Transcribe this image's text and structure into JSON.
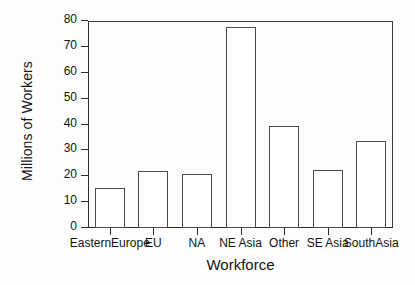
{
  "chart_data": {
    "type": "bar",
    "title": "",
    "xlabel": "Workforce",
    "ylabel": "Millions of Workers",
    "categories": [
      "EasternEurope",
      "EU",
      "NA",
      "NE Asia",
      "Other",
      "SE Asia",
      "SouthAsia"
    ],
    "values": [
      15.3,
      22.0,
      20.7,
      77.5,
      39.4,
      22.3,
      33.7
    ],
    "ylim": [
      0,
      80
    ],
    "ytick_labels": [
      "0",
      "10",
      "20",
      "30",
      "40",
      "50",
      "60",
      "70",
      "80"
    ],
    "ytick_values": [
      0,
      10,
      20,
      30,
      40,
      50,
      60,
      70,
      80
    ],
    "grid": false,
    "legend": false,
    "bar_fill_color": "#ffffff",
    "bar_edge_color": "#4a4a4a",
    "axis_color": "#2c2c2c",
    "background_color": "#fdfdfd"
  }
}
